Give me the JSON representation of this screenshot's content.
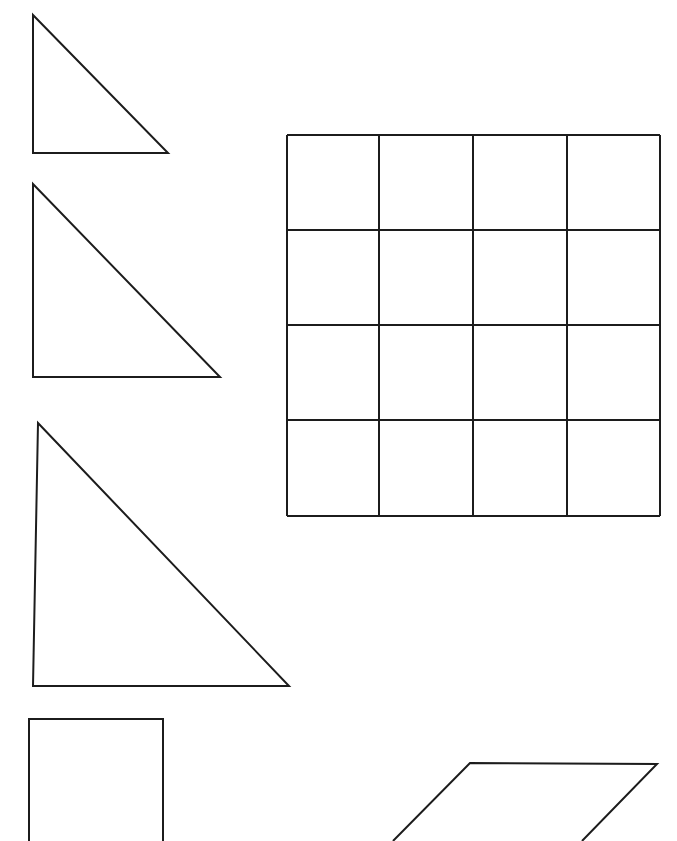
{
  "page": {
    "background_color": "#ffffff",
    "stroke_color": "#1c1c1c",
    "stroke_width": 2,
    "width": 677,
    "height": 841
  },
  "shapes": [
    {
      "id": "triangle-1",
      "name": "right-triangle-small",
      "type": "triangle",
      "label": "Right triangle (small)",
      "points": "33,15 33,153 168,153",
      "clipped": false
    },
    {
      "id": "triangle-2",
      "name": "right-triangle-medium",
      "type": "triangle",
      "label": "Right triangle (medium)",
      "points": "33,184 33,377 220,377",
      "clipped": false
    },
    {
      "id": "triangle-3",
      "name": "right-triangle-large",
      "type": "triangle",
      "label": "Right triangle (large)",
      "points": "38,423 33,686 289,686",
      "clipped": false
    },
    {
      "id": "rectangle-1",
      "name": "rectangle-bottom-left",
      "type": "rectangle",
      "label": "Rectangle (cropped at page bottom)",
      "points": "29,841 29,719 163,719 163,841",
      "clipped": true
    },
    {
      "id": "parallelogram-1",
      "name": "parallelogram-bottom-right",
      "type": "parallelogram",
      "label": "Parallelogram (cropped at page bottom)",
      "points": "393,841 470,763 657,764 582,841",
      "clipped": true
    },
    {
      "id": "grid-1",
      "name": "square-grid",
      "type": "grid",
      "label": "4 by 4 square grid",
      "rows": 4,
      "columns": 4,
      "x_lines": [
        287,
        379,
        473,
        567,
        660
      ],
      "y_lines": [
        135,
        230,
        325,
        420,
        516
      ],
      "clipped": false
    }
  ]
}
